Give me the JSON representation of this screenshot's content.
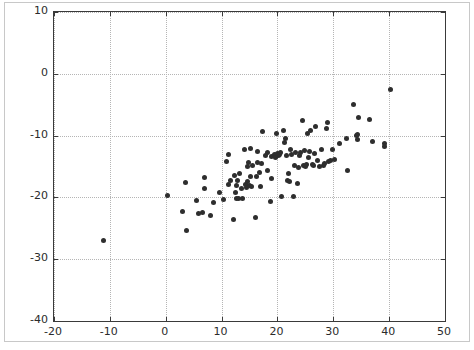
{
  "figure": {
    "width": 474,
    "height": 350,
    "background_color": "#ffffff",
    "frame_color": "#c8c8c8",
    "axes_color": "#3a3a3a",
    "grid_color": "#b5b5b5",
    "marker_color": "#2e2e2e"
  },
  "chart_data": {
    "type": "scatter",
    "title": "",
    "xlabel": "",
    "ylabel": "",
    "xlim": [
      -20,
      50
    ],
    "ylim": [
      -40,
      10
    ],
    "grid": true,
    "grid_style": "dotted",
    "legend": "none",
    "xticks": [
      -20,
      -10,
      0,
      10,
      20,
      30,
      40,
      50
    ],
    "yticks": [
      -40,
      -30,
      -20,
      -10,
      0,
      10
    ],
    "xticklabels": [
      "-20",
      "-10",
      "0",
      "10",
      "20",
      "30",
      "40",
      "50"
    ],
    "yticklabels": [
      "-40",
      "-30",
      "-20",
      "-10",
      "0",
      "10"
    ],
    "marker": "circle",
    "marker_size": 5,
    "n_points": 110,
    "series": [
      {
        "name": "observations",
        "color": "#2e2e2e",
        "points": [
          [
            -11.2,
            -26.9
          ],
          [
            0.3,
            -19.7
          ],
          [
            3.0,
            -22.3
          ],
          [
            3.6,
            -17.6
          ],
          [
            3.8,
            -25.3
          ],
          [
            5.5,
            -20.5
          ],
          [
            5.9,
            -22.6
          ],
          [
            6.6,
            -22.5
          ],
          [
            6.9,
            -16.8
          ],
          [
            7.0,
            -18.6
          ],
          [
            8.1,
            -22.9
          ],
          [
            8.6,
            -20.8
          ],
          [
            9.6,
            -19.2
          ],
          [
            10.4,
            -20.3
          ],
          [
            10.8,
            -14.2
          ],
          [
            11.2,
            -13.0
          ],
          [
            11.3,
            -17.9
          ],
          [
            11.6,
            -17.3
          ],
          [
            12.2,
            -23.6
          ],
          [
            12.4,
            -16.5
          ],
          [
            12.5,
            -19.2
          ],
          [
            12.6,
            -20.1
          ],
          [
            12.7,
            -18.1
          ],
          [
            12.8,
            -17.3
          ],
          [
            13.0,
            -20.2
          ],
          [
            13.2,
            -16.2
          ],
          [
            13.6,
            -18.6
          ],
          [
            13.8,
            -20.1
          ],
          [
            14.1,
            -12.3
          ],
          [
            14.3,
            -17.9
          ],
          [
            14.5,
            -18.4
          ],
          [
            14.6,
            -15.0
          ],
          [
            14.7,
            -17.5
          ],
          [
            14.8,
            -14.3
          ],
          [
            15.0,
            -18.0
          ],
          [
            15.1,
            -16.6
          ],
          [
            15.2,
            -12.1
          ],
          [
            15.4,
            -18.2
          ],
          [
            15.6,
            -14.9
          ],
          [
            16.0,
            -23.3
          ],
          [
            16.2,
            -16.6
          ],
          [
            16.4,
            -14.4
          ],
          [
            16.5,
            -12.6
          ],
          [
            16.8,
            -15.9
          ],
          [
            17.0,
            -18.2
          ],
          [
            17.2,
            -14.5
          ],
          [
            17.4,
            -9.4
          ],
          [
            17.9,
            -13.2
          ],
          [
            18.2,
            -15.6
          ],
          [
            18.3,
            -12.7
          ],
          [
            18.7,
            -20.6
          ],
          [
            18.9,
            -13.4
          ],
          [
            19.0,
            -17.0
          ],
          [
            19.4,
            -13.0
          ],
          [
            19.6,
            -13.6
          ],
          [
            19.8,
            -9.7
          ],
          [
            20.0,
            -12.9
          ],
          [
            20.2,
            -13.3
          ],
          [
            20.4,
            -13.0
          ],
          [
            20.6,
            -12.8
          ],
          [
            20.8,
            -19.9
          ],
          [
            21.0,
            -9.1
          ],
          [
            21.2,
            -11.1
          ],
          [
            21.4,
            -10.4
          ],
          [
            21.6,
            -13.2
          ],
          [
            21.8,
            -17.2
          ],
          [
            22.0,
            -16.1
          ],
          [
            22.2,
            -17.4
          ],
          [
            22.4,
            -12.3
          ],
          [
            22.6,
            -13.1
          ],
          [
            22.9,
            -19.9
          ],
          [
            23.1,
            -14.9
          ],
          [
            23.3,
            -12.7
          ],
          [
            23.6,
            -17.8
          ],
          [
            23.8,
            -15.1
          ],
          [
            24.0,
            -13.2
          ],
          [
            24.2,
            -12.8
          ],
          [
            24.4,
            -7.5
          ],
          [
            24.6,
            -14.8
          ],
          [
            24.8,
            -12.4
          ],
          [
            25.0,
            -15.0
          ],
          [
            25.2,
            -14.6
          ],
          [
            25.4,
            -9.6
          ],
          [
            25.6,
            -13.5
          ],
          [
            25.8,
            -12.6
          ],
          [
            26.0,
            -9.2
          ],
          [
            26.2,
            -14.7
          ],
          [
            26.4,
            -14.9
          ],
          [
            26.6,
            -12.9
          ],
          [
            26.8,
            -8.6
          ],
          [
            27.2,
            -14.1
          ],
          [
            27.6,
            -15.0
          ],
          [
            27.9,
            -12.2
          ],
          [
            28.2,
            -14.8
          ],
          [
            28.5,
            -14.5
          ],
          [
            28.7,
            -8.8
          ],
          [
            28.9,
            -7.8
          ],
          [
            29.2,
            -14.2
          ],
          [
            29.5,
            -14.0
          ],
          [
            29.8,
            -12.3
          ],
          [
            30.3,
            -13.9
          ],
          [
            31.2,
            -11.2
          ],
          [
            32.3,
            -10.5
          ],
          [
            32.6,
            -15.7
          ],
          [
            33.6,
            -5.0
          ],
          [
            34.2,
            -10.0
          ],
          [
            34.3,
            -9.8
          ],
          [
            34.4,
            -10.6
          ],
          [
            34.6,
            -7.1
          ],
          [
            36.4,
            -7.4
          ],
          [
            37.0,
            -11.0
          ],
          [
            39.1,
            -11.3
          ],
          [
            39.2,
            -11.7
          ],
          [
            40.3,
            -2.6
          ]
        ]
      }
    ]
  }
}
